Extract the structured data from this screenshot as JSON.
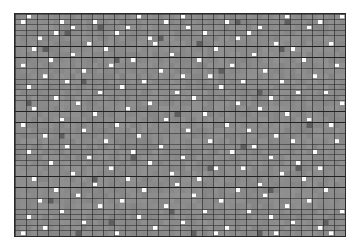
{
  "figure": {
    "type": "matrix-heatmap",
    "background_color": "#ffffff",
    "border_color": "#2a2a2a"
  },
  "chart_data": {
    "type": "heatmap",
    "title": "",
    "subtitle": "",
    "xlabel": "",
    "ylabel": "",
    "legend": [],
    "annotations": [],
    "grid": true,
    "grid_line_color_major": "#222222",
    "grid_line_color_minor": "#555555",
    "grid_major_every_cols": 2,
    "grid_major_every_rows": 2,
    "cols": 60,
    "rows": 41,
    "cell_width_px": 5.5,
    "cell_height_px": 5.45,
    "plot_area": {
      "x": 14,
      "y": 13,
      "width": 332,
      "height": 224
    },
    "value_levels": {
      "base": 0,
      "dark": -1,
      "highlight": 1
    },
    "colors": {
      "base": "#8b8b8b",
      "dark": "#5e5e5e",
      "highlight": "#fdfdfd"
    },
    "highlight_cells": [
      [
        0,
        2
      ],
      [
        0,
        22
      ],
      [
        0,
        30
      ],
      [
        0,
        49
      ],
      [
        0,
        59
      ],
      [
        1,
        1
      ],
      [
        1,
        8
      ],
      [
        1,
        14
      ],
      [
        1,
        27
      ],
      [
        1,
        38
      ],
      [
        1,
        55
      ],
      [
        2,
        10
      ],
      [
        2,
        20
      ],
      [
        2,
        31
      ],
      [
        2,
        44
      ],
      [
        2,
        53
      ],
      [
        3,
        7
      ],
      [
        3,
        18
      ],
      [
        3,
        34
      ],
      [
        3,
        42
      ],
      [
        4,
        4
      ],
      [
        4,
        24
      ],
      [
        4,
        40
      ],
      [
        5,
        13
      ],
      [
        5,
        25
      ],
      [
        5,
        47
      ],
      [
        5,
        57
      ],
      [
        6,
        3
      ],
      [
        6,
        16
      ],
      [
        6,
        36
      ],
      [
        6,
        50
      ],
      [
        7,
        10
      ],
      [
        7,
        28
      ],
      [
        7,
        43
      ],
      [
        8,
        6
      ],
      [
        8,
        21
      ],
      [
        8,
        33
      ],
      [
        8,
        52
      ],
      [
        9,
        1
      ],
      [
        9,
        17
      ],
      [
        9,
        39
      ],
      [
        9,
        58
      ],
      [
        10,
        12
      ],
      [
        10,
        26
      ],
      [
        10,
        45
      ],
      [
        11,
        5
      ],
      [
        11,
        30
      ],
      [
        11,
        35
      ],
      [
        11,
        54
      ],
      [
        12,
        9
      ],
      [
        12,
        23
      ],
      [
        12,
        41
      ],
      [
        12,
        48
      ],
      [
        13,
        2
      ],
      [
        13,
        19
      ],
      [
        13,
        37
      ],
      [
        14,
        15
      ],
      [
        14,
        29
      ],
      [
        14,
        51
      ],
      [
        14,
        56
      ],
      [
        15,
        7
      ],
      [
        15,
        32
      ],
      [
        15,
        46
      ],
      [
        16,
        11
      ],
      [
        16,
        24
      ],
      [
        16,
        40
      ],
      [
        16,
        59
      ],
      [
        17,
        3
      ],
      [
        17,
        20
      ],
      [
        17,
        44
      ],
      [
        18,
        14
      ],
      [
        18,
        34
      ],
      [
        18,
        49
      ],
      [
        19,
        8
      ],
      [
        19,
        27
      ],
      [
        19,
        53
      ],
      [
        20,
        1
      ],
      [
        20,
        18
      ],
      [
        20,
        38
      ],
      [
        20,
        57
      ],
      [
        21,
        12
      ],
      [
        21,
        31
      ],
      [
        21,
        42
      ],
      [
        22,
        5
      ],
      [
        22,
        22
      ],
      [
        22,
        47
      ],
      [
        23,
        16
      ],
      [
        23,
        35
      ],
      [
        23,
        50
      ],
      [
        23,
        58
      ],
      [
        24,
        9
      ],
      [
        24,
        26
      ],
      [
        24,
        43
      ],
      [
        25,
        2
      ],
      [
        25,
        21
      ],
      [
        25,
        39
      ],
      [
        25,
        54
      ],
      [
        26,
        13
      ],
      [
        26,
        30
      ],
      [
        26,
        46
      ],
      [
        27,
        6
      ],
      [
        27,
        24
      ],
      [
        27,
        51
      ],
      [
        28,
        17
      ],
      [
        28,
        36
      ],
      [
        28,
        41
      ],
      [
        28,
        55
      ],
      [
        29,
        10
      ],
      [
        29,
        28
      ],
      [
        29,
        48
      ],
      [
        30,
        3
      ],
      [
        30,
        20
      ],
      [
        30,
        33
      ],
      [
        30,
        52
      ],
      [
        31,
        14
      ],
      [
        31,
        29
      ],
      [
        31,
        44
      ],
      [
        32,
        7
      ],
      [
        32,
        23
      ],
      [
        32,
        40
      ],
      [
        32,
        56
      ],
      [
        33,
        11
      ],
      [
        33,
        32
      ],
      [
        33,
        45
      ],
      [
        34,
        4
      ],
      [
        34,
        19
      ],
      [
        34,
        37
      ],
      [
        34,
        53
      ],
      [
        35,
        15
      ],
      [
        35,
        27
      ],
      [
        35,
        49
      ],
      [
        36,
        8
      ],
      [
        36,
        34
      ],
      [
        36,
        42
      ],
      [
        36,
        59
      ],
      [
        37,
        2
      ],
      [
        37,
        22
      ],
      [
        37,
        46
      ],
      [
        38,
        12
      ],
      [
        38,
        30
      ],
      [
        38,
        50
      ],
      [
        39,
        5
      ],
      [
        39,
        25
      ],
      [
        39,
        38
      ],
      [
        39,
        55
      ],
      [
        40,
        1
      ],
      [
        40,
        18
      ],
      [
        40,
        36
      ],
      [
        40,
        47
      ],
      [
        40,
        57
      ]
    ],
    "dark_cells": [
      [
        1,
        40
      ],
      [
        1,
        49
      ],
      [
        2,
        15
      ],
      [
        3,
        9
      ],
      [
        4,
        26
      ],
      [
        5,
        33
      ],
      [
        6,
        5
      ],
      [
        6,
        48
      ],
      [
        8,
        18
      ],
      [
        10,
        37
      ],
      [
        12,
        12
      ],
      [
        14,
        44
      ],
      [
        16,
        2
      ],
      [
        18,
        29
      ],
      [
        20,
        53
      ],
      [
        22,
        8
      ],
      [
        24,
        41
      ],
      [
        26,
        21
      ],
      [
        28,
        35
      ],
      [
        28,
        51
      ],
      [
        30,
        14
      ],
      [
        32,
        46
      ],
      [
        34,
        6
      ],
      [
        36,
        28
      ],
      [
        38,
        17
      ],
      [
        38,
        56
      ],
      [
        40,
        11
      ],
      [
        40,
        32
      ],
      [
        40,
        44
      ]
    ]
  }
}
